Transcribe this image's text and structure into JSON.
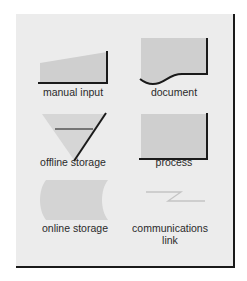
{
  "diagram": {
    "title": "",
    "colors": {
      "panel_bg": "#ececec",
      "shape_fill": "#cfcfcf",
      "shape_fill_light": "#d6d6d6",
      "stroke": "#1a1a1a",
      "link_stroke": "#c4c4c4",
      "label": "#2a2a2a"
    },
    "symbols": [
      {
        "id": "manual-input",
        "label": "manual input"
      },
      {
        "id": "document",
        "label": "document"
      },
      {
        "id": "offline-storage",
        "label": "offline storage"
      },
      {
        "id": "process",
        "label": "process"
      },
      {
        "id": "online-storage",
        "label": "online storage"
      },
      {
        "id": "communications-link",
        "label": "communications link"
      }
    ]
  }
}
